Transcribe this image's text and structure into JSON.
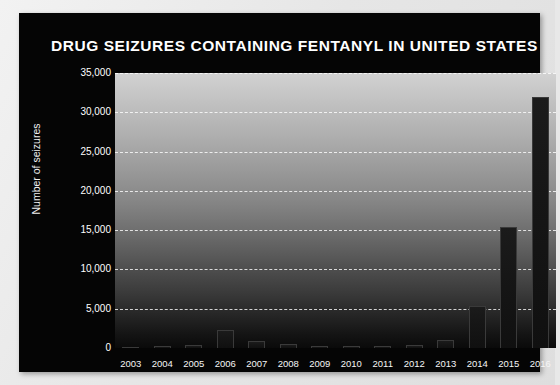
{
  "chart_data": {
    "type": "bar",
    "title": "DRUG SEIZURES CONTAINING FENTANYL IN UNITED STATES",
    "xlabel": "",
    "ylabel": "Number of seizures",
    "categories": [
      "2003",
      "2004",
      "2005",
      "2006",
      "2007",
      "2008",
      "2009",
      "2010",
      "2011",
      "2012",
      "2013",
      "2014",
      "2015",
      "2016"
    ],
    "values": [
      180,
      280,
      350,
      2300,
      900,
      450,
      300,
      260,
      240,
      330,
      1000,
      5300,
      15400,
      32000
    ],
    "ylim": [
      0,
      35000
    ],
    "ytick_labels": [
      "0",
      "5,000",
      "10,000",
      "15,000",
      "20,000",
      "25,000",
      "30,000",
      "35,000"
    ],
    "ytick_values": [
      0,
      5000,
      10000,
      15000,
      20000,
      25000,
      30000,
      35000
    ],
    "grid": true,
    "legend": false,
    "bar_color": "#151515",
    "plot_bg_top": "#d2d2d2",
    "plot_bg_bottom": "#0a0a0a",
    "card_bg": "#050505",
    "title_color": "#ffffff",
    "page_bg": "#e8e8e8"
  }
}
